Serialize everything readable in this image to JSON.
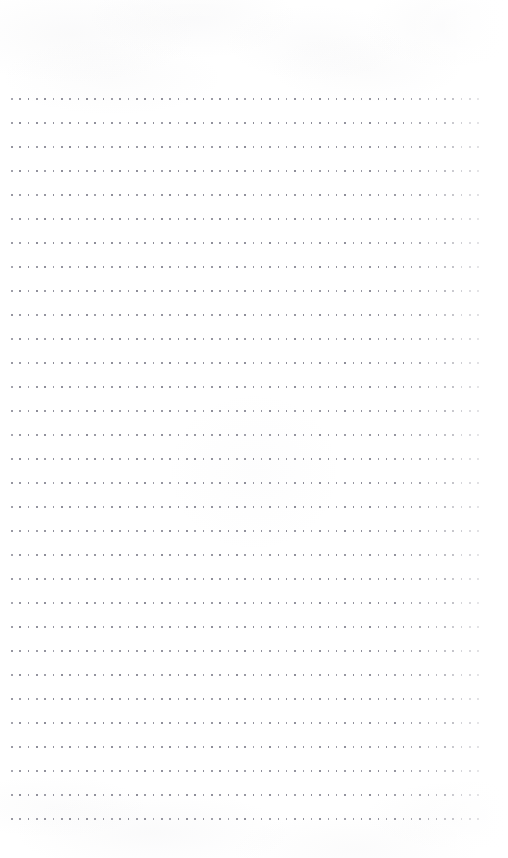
{
  "page": {
    "kind": "scanned-dot-grid-notebook-page",
    "width_px": 508,
    "height_px": 858,
    "background_color": "#ffffff",
    "is_blank": true,
    "visible_text": "",
    "annotations_present": false
  },
  "grid": {
    "dot_color": "#8a8a96",
    "dot_size_px": 1.6,
    "dot_shape": "square",
    "column_spacing_px": 8.33,
    "row_spacing_px": 24,
    "origin_x_px": 11,
    "origin_y_px": 98,
    "rows": 31,
    "columns": 57,
    "last_row_y_px": 818,
    "last_column_x_px": 478
  },
  "margins": {
    "top_px": 98,
    "bottom_px": 40,
    "left_px": 11,
    "right_px": 30
  },
  "texture": {
    "description": "faint warm-gray scanner mottling in top and bottom margins",
    "tint_color": "#a8a8b2",
    "right_edge_print_falloff": true
  }
}
